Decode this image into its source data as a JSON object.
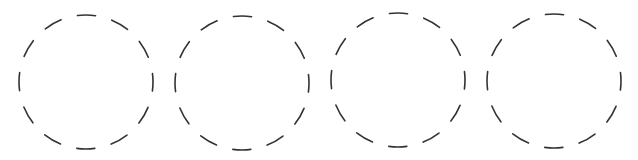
{
  "diagram": {
    "background": "#ffffff",
    "stroke_color": "#333333",
    "stroke_width": 1.6,
    "dash_count": 12,
    "circles": [
      {
        "id": "circle-1",
        "cx": 86,
        "cy": 82,
        "r": 67
      },
      {
        "id": "circle-2",
        "cx": 242,
        "cy": 83,
        "r": 67
      },
      {
        "id": "circle-3",
        "cx": 398,
        "cy": 80,
        "r": 67
      },
      {
        "id": "circle-4",
        "cx": 554,
        "cy": 81,
        "r": 67
      }
    ]
  }
}
